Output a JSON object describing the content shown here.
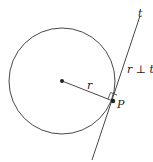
{
  "diagram": {
    "title": "",
    "circle": {
      "cx": 62,
      "cy": 81,
      "r": 53
    },
    "center_point": {
      "x": 62,
      "y": 81
    },
    "tangent_point": {
      "x": 113,
      "y": 101,
      "label": "P"
    },
    "radius_segment": {
      "label": "r"
    },
    "tangent_line": {
      "x1": 140,
      "y1": 16,
      "x2": 92,
      "y2": 160,
      "label": "t"
    },
    "relation_label": "r ⊥ t",
    "colors": {
      "stroke": "#333333",
      "background": "#ffffff"
    }
  }
}
